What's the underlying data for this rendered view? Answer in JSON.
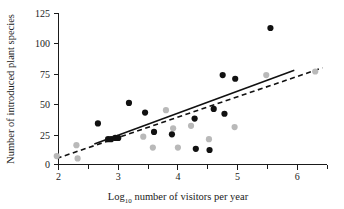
{
  "chart_data": {
    "type": "scatter",
    "title": "",
    "xlabel": "Log10 number of visitors per year",
    "xlabel_base": "Log",
    "xlabel_sub": "10",
    "xlabel_rest": " number of visitors per year",
    "ylabel": "Number of introduced plant species",
    "xlim": [
      1.75,
      6.6
    ],
    "ylim": [
      0,
      125
    ],
    "xticks": [
      2,
      3,
      4,
      5,
      6
    ],
    "xtick_labels": [
      "2",
      "3",
      "4",
      "5",
      "6"
    ],
    "xminor_ticks": [
      2.5,
      3.5,
      4.5,
      5.5,
      6.5
    ],
    "yticks": [
      0,
      25,
      50,
      75,
      100,
      125
    ],
    "ytick_labels": [
      "0",
      "25",
      "50",
      "75",
      "100",
      "125"
    ],
    "grid": false,
    "legend": "none",
    "series": [
      {
        "name": "dark-points",
        "marker": "filled-circle",
        "color": "#111111",
        "points": [
          [
            2.66,
            34
          ],
          [
            2.83,
            21
          ],
          [
            2.88,
            21
          ],
          [
            2.95,
            22
          ],
          [
            3.0,
            22
          ],
          [
            3.18,
            51
          ],
          [
            3.45,
            43
          ],
          [
            3.6,
            27
          ],
          [
            3.9,
            25
          ],
          [
            4.28,
            38
          ],
          [
            4.3,
            13
          ],
          [
            4.53,
            12
          ],
          [
            4.6,
            46
          ],
          [
            4.75,
            74
          ],
          [
            4.78,
            42
          ],
          [
            4.96,
            71
          ],
          [
            5.55,
            113
          ]
        ]
      },
      {
        "name": "gray-points",
        "marker": "filled-circle",
        "color": "#b9b9b9",
        "points": [
          [
            1.97,
            7
          ],
          [
            2.3,
            16
          ],
          [
            2.32,
            5
          ],
          [
            3.0,
            22
          ],
          [
            3.42,
            23
          ],
          [
            3.58,
            14
          ],
          [
            3.8,
            45
          ],
          [
            3.92,
            30
          ],
          [
            4.0,
            14
          ],
          [
            4.22,
            32
          ],
          [
            4.52,
            21
          ],
          [
            4.95,
            31
          ],
          [
            5.48,
            74
          ],
          [
            6.3,
            77
          ]
        ]
      }
    ],
    "fit_lines": [
      {
        "name": "solid-regression-line",
        "style": "solid",
        "x": [
          2.6,
          5.95
        ],
        "y": [
          17,
          78
        ]
      },
      {
        "name": "dashed-regression-line",
        "style": "dashed",
        "x": [
          1.97,
          6.42
        ],
        "y": [
          5,
          80
        ]
      }
    ]
  }
}
